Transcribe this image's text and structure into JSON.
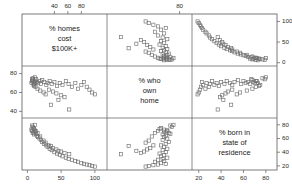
{
  "figure": {
    "type": "scatterplot-matrix",
    "variables": [
      {
        "key": "homes100k",
        "label_lines": [
          "% homes",
          "cost",
          "$100K+"
        ]
      },
      {
        "key": "ownhome",
        "label_lines": [
          "% who",
          "own",
          "home"
        ]
      },
      {
        "key": "bornstate",
        "label_lines": [
          "% born in",
          "state of",
          "residence"
        ]
      }
    ],
    "marker": {
      "shape": "open-square",
      "size_px": 3.2,
      "stroke": "#6f6f6f",
      "fill": "none"
    },
    "frame_color": "#5a5a5a",
    "text_color": "#1a1a1a"
  },
  "axes": {
    "top": {
      "ticks": [
        40,
        60,
        80
      ],
      "for_column": 0,
      "label": ""
    },
    "top_right": {
      "ticks": [
        80
      ],
      "for_column": 1,
      "label": ""
    },
    "right_top": {
      "ticks": [
        0,
        50,
        100
      ],
      "for_row": 0,
      "label": ""
    },
    "right_bottom": {
      "ticks": [
        20,
        40,
        60,
        80
      ],
      "for_row": 2,
      "label": ""
    },
    "left": {
      "ticks": [
        40,
        60,
        80
      ],
      "for_row": 1,
      "label": ""
    },
    "bottom_left": {
      "ticks": [
        0,
        50,
        100
      ],
      "for_column": 0,
      "label": ""
    },
    "bottom_right": {
      "ticks": [
        20,
        40,
        60,
        80
      ],
      "for_column": 2,
      "label": ""
    }
  },
  "chart_data": {
    "type": "scatter",
    "title": "",
    "subtitle": "",
    "xlabel": "",
    "ylabel": "",
    "grid": false,
    "legend": "none",
    "matrix": true,
    "variables": [
      "% homes cost $100K+",
      "% who own home",
      "% born in state of residence"
    ],
    "axis_ranges": {
      "% homes cost $100K+": [
        -8,
        118
      ],
      "% who own home": [
        33,
        88
      ],
      "% born in state of residence": [
        14,
        90
      ]
    },
    "n_points": 51,
    "points": [
      {
        "homes100k": 7,
        "ownhome": 72,
        "bornstate": 71
      },
      {
        "homes100k": 9,
        "ownhome": 71,
        "bornstate": 69
      },
      {
        "homes100k": 6,
        "ownhome": 70,
        "bornstate": 73
      },
      {
        "homes100k": 8,
        "ownhome": 73,
        "bornstate": 68
      },
      {
        "homes100k": 10,
        "ownhome": 69,
        "bornstate": 66
      },
      {
        "homes100k": 11,
        "ownhome": 72,
        "bornstate": 72
      },
      {
        "homes100k": 12,
        "ownhome": 70,
        "bornstate": 70
      },
      {
        "homes100k": 13,
        "ownhome": 74,
        "bornstate": 67
      },
      {
        "homes100k": 9,
        "ownhome": 68,
        "bornstate": 75
      },
      {
        "homes100k": 14,
        "ownhome": 71,
        "bornstate": 64
      },
      {
        "homes100k": 8,
        "ownhome": 75,
        "bornstate": 77
      },
      {
        "homes100k": 16,
        "ownhome": 70,
        "bornstate": 62
      },
      {
        "homes100k": 10,
        "ownhome": 67,
        "bornstate": 74
      },
      {
        "homes100k": 18,
        "ownhome": 72,
        "bornstate": 60
      },
      {
        "homes100k": 7,
        "ownhome": 74,
        "bornstate": 79
      },
      {
        "homes100k": 20,
        "ownhome": 69,
        "bornstate": 58
      },
      {
        "homes100k": 12,
        "ownhome": 66,
        "bornstate": 71
      },
      {
        "homes100k": 22,
        "ownhome": 73,
        "bornstate": 55
      },
      {
        "homes100k": 15,
        "ownhome": 64,
        "bornstate": 68
      },
      {
        "homes100k": 25,
        "ownhome": 71,
        "bornstate": 52
      },
      {
        "homes100k": 11,
        "ownhome": 76,
        "bornstate": 80
      },
      {
        "homes100k": 28,
        "ownhome": 68,
        "bornstate": 50
      },
      {
        "homes100k": 30,
        "ownhome": 70,
        "bornstate": 48
      },
      {
        "homes100k": 19,
        "ownhome": 62,
        "bornstate": 63
      },
      {
        "homes100k": 33,
        "ownhome": 72,
        "bornstate": 45
      },
      {
        "homes100k": 24,
        "ownhome": 60,
        "bornstate": 57
      },
      {
        "homes100k": 36,
        "ownhome": 69,
        "bornstate": 43
      },
      {
        "homes100k": 40,
        "ownhome": 71,
        "bornstate": 40
      },
      {
        "homes100k": 27,
        "ownhome": 58,
        "bornstate": 54
      },
      {
        "homes100k": 44,
        "ownhome": 67,
        "bornstate": 38
      },
      {
        "homes100k": 48,
        "ownhome": 70,
        "bornstate": 36
      },
      {
        "homes100k": 32,
        "ownhome": 63,
        "bornstate": 50
      },
      {
        "homes100k": 52,
        "ownhome": 68,
        "bornstate": 34
      },
      {
        "homes100k": 57,
        "ownhome": 72,
        "bornstate": 32
      },
      {
        "homes100k": 38,
        "ownhome": 61,
        "bornstate": 46
      },
      {
        "homes100k": 61,
        "ownhome": 69,
        "bornstate": 30
      },
      {
        "homes100k": 66,
        "ownhome": 66,
        "bornstate": 29
      },
      {
        "homes100k": 43,
        "ownhome": 59,
        "bornstate": 44
      },
      {
        "homes100k": 71,
        "ownhome": 70,
        "bornstate": 27
      },
      {
        "homes100k": 75,
        "ownhome": 64,
        "bornstate": 26
      },
      {
        "homes100k": 50,
        "ownhome": 57,
        "bornstate": 41
      },
      {
        "homes100k": 80,
        "ownhome": 68,
        "bornstate": 24
      },
      {
        "homes100k": 84,
        "ownhome": 71,
        "bornstate": 23
      },
      {
        "homes100k": 55,
        "ownhome": 55,
        "bornstate": 39
      },
      {
        "homes100k": 88,
        "ownhome": 66,
        "bornstate": 22
      },
      {
        "homes100k": 92,
        "ownhome": 63,
        "bornstate": 21
      },
      {
        "homes100k": 62,
        "ownhome": 42,
        "bornstate": 37
      },
      {
        "homes100k": 96,
        "ownhome": 60,
        "bornstate": 20
      },
      {
        "homes100k": 100,
        "ownhome": 58,
        "bornstate": 19
      },
      {
        "homes100k": 46,
        "ownhome": 52,
        "bornstate": 42
      },
      {
        "homes100k": 35,
        "ownhome": 47,
        "bornstate": 49
      }
    ]
  }
}
